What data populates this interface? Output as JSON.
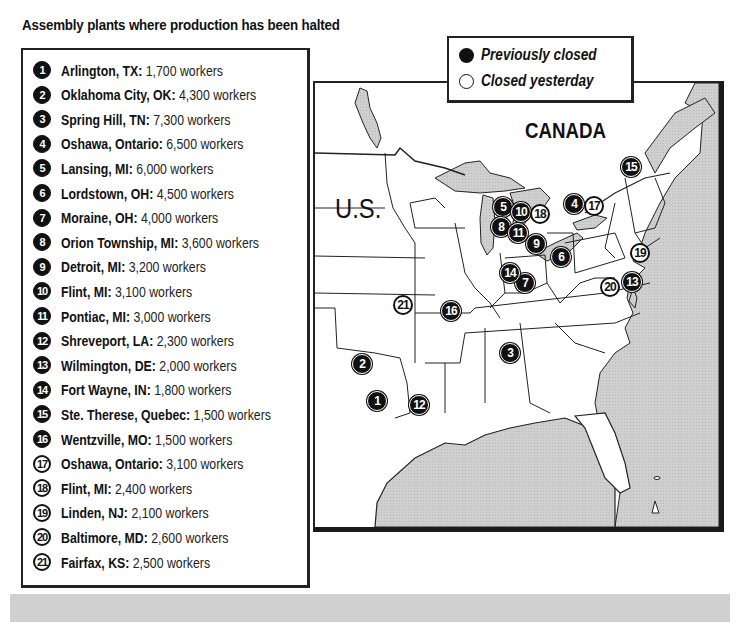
{
  "title": "Assembly plants where production has been halted",
  "legend": {
    "previously_closed": "Previously closed",
    "closed_yesterday": "Closed yesterday"
  },
  "map_labels": {
    "canada": "CANADA",
    "us": "U.S."
  },
  "plants": [
    {
      "num": "1",
      "place": "Arlington, TX:",
      "workers": "1,700 workers",
      "status": "previously_closed"
    },
    {
      "num": "2",
      "place": "Oklahoma City, OK:",
      "workers": "4,300 workers",
      "status": "previously_closed"
    },
    {
      "num": "3",
      "place": "Spring Hill, TN:",
      "workers": "7,300 workers",
      "status": "previously_closed"
    },
    {
      "num": "4",
      "place": "Oshawa, Ontario:",
      "workers": "6,500 workers",
      "status": "previously_closed"
    },
    {
      "num": "5",
      "place": "Lansing, MI:",
      "workers": "6,000 workers",
      "status": "previously_closed"
    },
    {
      "num": "6",
      "place": "Lordstown, OH:",
      "workers": "4,500 workers",
      "status": "previously_closed"
    },
    {
      "num": "7",
      "place": "Moraine, OH:",
      "workers": "4,000 workers",
      "status": "previously_closed"
    },
    {
      "num": "8",
      "place": "Orion Township, MI:",
      "workers": "3,600 workers",
      "status": "previously_closed"
    },
    {
      "num": "9",
      "place": "Detroit, MI:",
      "workers": "3,200 workers",
      "status": "previously_closed"
    },
    {
      "num": "10",
      "place": "Flint, MI:",
      "workers": "3,100 workers",
      "status": "previously_closed"
    },
    {
      "num": "11",
      "place": "Pontiac, MI:",
      "workers": "3,000 workers",
      "status": "previously_closed"
    },
    {
      "num": "12",
      "place": "Shreveport, LA:",
      "workers": "2,300 workers",
      "status": "previously_closed"
    },
    {
      "num": "13",
      "place": "Wilmington, DE:",
      "workers": "2,000 workers",
      "status": "previously_closed"
    },
    {
      "num": "14",
      "place": "Fort Wayne, IN:",
      "workers": "1,800 workers",
      "status": "previously_closed"
    },
    {
      "num": "15",
      "place": "Ste. Therese, Quebec:",
      "workers": "1,500 workers",
      "status": "previously_closed"
    },
    {
      "num": "16",
      "place": "Wentzville, MO:",
      "workers": "1,500 workers",
      "status": "previously_closed"
    },
    {
      "num": "17",
      "place": "Oshawa, Ontario:",
      "workers": "3,100 workers",
      "status": "closed_yesterday"
    },
    {
      "num": "18",
      "place": "Flint, MI:",
      "workers": "2,400 workers",
      "status": "closed_yesterday"
    },
    {
      "num": "19",
      "place": "Linden, NJ:",
      "workers": "2,100 workers",
      "status": "closed_yesterday"
    },
    {
      "num": "20",
      "place": "Baltimore, MD:",
      "workers": "2,600 workers",
      "status": "closed_yesterday"
    },
    {
      "num": "21",
      "place": "Fairfax, KS:",
      "workers": "2,500 workers",
      "status": "closed_yesterday"
    }
  ],
  "map_markers": [
    {
      "num": "1",
      "x": 377,
      "y": 401,
      "status": "previously_closed"
    },
    {
      "num": "2",
      "x": 362,
      "y": 364,
      "status": "previously_closed"
    },
    {
      "num": "3",
      "x": 510,
      "y": 353,
      "status": "previously_closed"
    },
    {
      "num": "4",
      "x": 574,
      "y": 204,
      "status": "previously_closed"
    },
    {
      "num": "5",
      "x": 503,
      "y": 207,
      "status": "previously_closed"
    },
    {
      "num": "6",
      "x": 561,
      "y": 257,
      "status": "previously_closed"
    },
    {
      "num": "7",
      "x": 525,
      "y": 283,
      "status": "previously_closed"
    },
    {
      "num": "8",
      "x": 501,
      "y": 227,
      "status": "previously_closed"
    },
    {
      "num": "9",
      "x": 536,
      "y": 244,
      "status": "previously_closed"
    },
    {
      "num": "10",
      "x": 521,
      "y": 212,
      "status": "previously_closed"
    },
    {
      "num": "11",
      "x": 518,
      "y": 233,
      "status": "previously_closed"
    },
    {
      "num": "12",
      "x": 419,
      "y": 405,
      "status": "previously_closed"
    },
    {
      "num": "13",
      "x": 632,
      "y": 282,
      "status": "previously_closed"
    },
    {
      "num": "14",
      "x": 510,
      "y": 273,
      "status": "previously_closed"
    },
    {
      "num": "15",
      "x": 631,
      "y": 167,
      "status": "previously_closed"
    },
    {
      "num": "16",
      "x": 451,
      "y": 311,
      "status": "previously_closed"
    },
    {
      "num": "17",
      "x": 594,
      "y": 206,
      "status": "closed_yesterday"
    },
    {
      "num": "18",
      "x": 540,
      "y": 214,
      "status": "closed_yesterday"
    },
    {
      "num": "19",
      "x": 640,
      "y": 253,
      "status": "closed_yesterday"
    },
    {
      "num": "20",
      "x": 610,
      "y": 287,
      "status": "closed_yesterday"
    },
    {
      "num": "21",
      "x": 403,
      "y": 305,
      "status": "closed_yesterday"
    }
  ]
}
